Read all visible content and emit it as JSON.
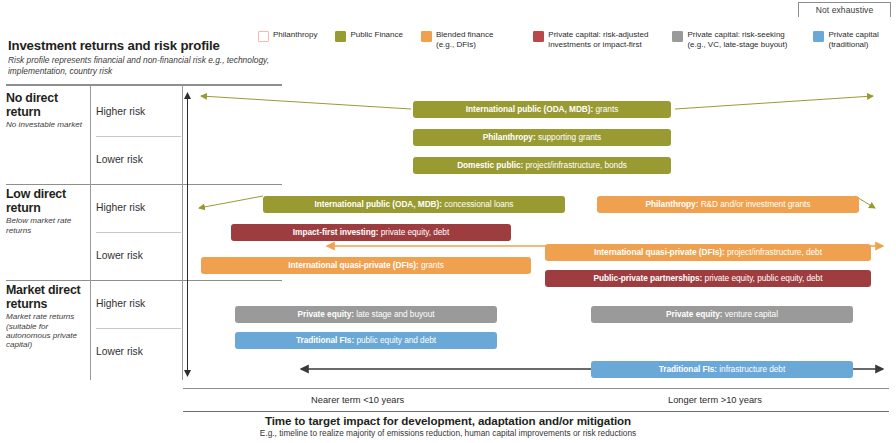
{
  "badge": {
    "label": "Not exhaustive"
  },
  "header": {
    "title": "Investment returns and risk profile",
    "subtitle": "Risk profile represents financial and non-financial risk e.g., technology, implementation, country risk"
  },
  "legend": {
    "items": [
      {
        "label": "Philanthropy",
        "color": "#ffffff",
        "border": "#f4b9b2"
      },
      {
        "label": "Public Finance",
        "color": "#9a9a33",
        "border": "#9a9a33"
      },
      {
        "label": "Blended finance\n(e.g., DFIs)",
        "color": "#efa14f",
        "border": "#efa14f"
      },
      {
        "label": "Private capital: risk-adjusted\ninvestments or impact-first",
        "color": "#b8484b",
        "border": "#b8484b"
      },
      {
        "label": "Private capital: risk-seeking\n(e.g., VC, late-stage buyout)",
        "color": "#9a9a9a",
        "border": "#9a9a9a"
      },
      {
        "label": "Private capital\n(traditional)",
        "color": "#6aa8d8",
        "border": "#6aa8d8"
      }
    ]
  },
  "rows": [
    {
      "title": "No direct return",
      "note": "No investable market",
      "risks": [
        "Higher risk",
        "Lower risk"
      ]
    },
    {
      "title": "Low direct return",
      "note": "Below market rate returns",
      "risks": [
        "Higher risk",
        "Lower risk"
      ]
    },
    {
      "title": "Market direct returns",
      "note": "Market rate returns (suitable for autonomous private capital)",
      "risks": [
        "Higher risk",
        "Lower risk"
      ]
    }
  ],
  "axis": {
    "y_top": "higher",
    "y_bottom": "lower",
    "x_left_label": "Nearer term <10 years",
    "x_right_label": "Longer term >10 years",
    "caption_main": "Time to target impact for development, adaptation and/or mitigation",
    "caption_sub": "E.g., timeline to realize majority of emissions reduction, human capital improvements or risk reductions"
  },
  "chart_data": {
    "type": "bar",
    "title": "Investment returns and risk profile",
    "xlabel": "Time to target impact for development, adaptation and/or mitigation",
    "ylabel": "Investment returns and risk profile",
    "xlim": [
      0,
      706
    ],
    "ylim": [
      0,
      300
    ],
    "grid": false,
    "legend_position": "top",
    "categories": [
      "No direct return / Higher risk",
      "No direct return / Lower risk",
      "Low direct return / Higher risk",
      "Low direct return / Lower risk",
      "Market direct returns / Higher risk",
      "Market direct returns / Lower risk"
    ],
    "bars": [
      {
        "bold": "International public (ODA, MDB):",
        "sub": " grants",
        "category": "Public Finance",
        "color": "#9a9a33",
        "row": "No direct return / Higher risk",
        "x": 230,
        "y": 17,
        "w": 258
      },
      {
        "bold": "Philanthropy:",
        "sub": " supporting grants",
        "category": "Public Finance",
        "color": "#9a9a33",
        "row": "No direct return / Higher risk",
        "x": 230,
        "y": 45,
        "w": 258
      },
      {
        "bold": "Domestic public:",
        "sub": " project/infrastructure, bonds",
        "category": "Public Finance",
        "color": "#9a9a33",
        "row": "No direct return / Lower risk",
        "x": 230,
        "y": 73,
        "w": 258
      },
      {
        "bold": "International public (ODA, MDB):",
        "sub": " concessional loans",
        "category": "Public Finance",
        "color": "#9a9a33",
        "row": "Low direct return / Higher risk",
        "x": 80,
        "y": 112,
        "w": 302
      },
      {
        "bold": "Philanthropy:",
        "sub": " R&D and/or investment grants",
        "category": "Blended finance",
        "color": "#efa14f",
        "row": "Low direct return / Higher risk",
        "x": 414,
        "y": 112,
        "w": 262
      },
      {
        "bold": "Impact-first investing:",
        "sub": " private equity, debt",
        "category": "Private capital: risk-adjusted",
        "color": "#9e3d40",
        "row": "Low direct return / Higher risk",
        "x": 48,
        "y": 140,
        "w": 280
      },
      {
        "bold": "International quasi-private (DFIs):",
        "sub": " project/infrastructure, debt",
        "category": "Blended finance",
        "color": "#efa14f",
        "row": "Low direct return / Lower risk",
        "x": 362,
        "y": 160,
        "w": 326
      },
      {
        "bold": "International quasi-private (DFIs):",
        "sub": " grants",
        "category": "Blended finance",
        "color": "#efa14f",
        "row": "Low direct return / Lower risk",
        "x": 18,
        "y": 173,
        "w": 330
      },
      {
        "bold": "Public-private partnerships:",
        "sub": " private equity, public equity, debt",
        "category": "Private capital: risk-adjusted",
        "color": "#9e3d40",
        "row": "Low direct return / Lower risk",
        "x": 362,
        "y": 186,
        "w": 326
      },
      {
        "bold": "Private equity:",
        "sub": " late stage and buyout",
        "category": "Private capital: risk-seeking",
        "color": "#9a9a9a",
        "row": "Market direct returns / Higher risk",
        "x": 52,
        "y": 222,
        "w": 262
      },
      {
        "bold": "Private equity:",
        "sub": " venture capital",
        "category": "Private capital: risk-seeking",
        "color": "#9a9a9a",
        "row": "Market direct returns / Higher risk",
        "x": 408,
        "y": 222,
        "w": 262
      },
      {
        "bold": "Traditional FIs:",
        "sub": " public equity and debt",
        "category": "Private capital (traditional)",
        "color": "#6aa8d8",
        "row": "Market direct returns / Higher risk",
        "x": 52,
        "y": 248,
        "w": 262
      },
      {
        "bold": "Traditional FIs:",
        "sub": " infrastructure debt",
        "category": "Private capital (traditional)",
        "color": "#6aa8d8",
        "row": "Market direct returns / Lower risk",
        "x": 408,
        "y": 277,
        "w": 262
      }
    ],
    "arrows": [
      {
        "name": "public-finance-spread-top",
        "color": "#9a9a33",
        "x1": 228,
        "y1": 25,
        "x2": 18,
        "y2": 12
      },
      {
        "name": "public-finance-spread-top-right",
        "color": "#9a9a33",
        "x1": 492,
        "y1": 25,
        "x2": 690,
        "y2": 12
      },
      {
        "name": "public-finance-spread-mid-left",
        "color": "#9a9a33",
        "x1": 80,
        "y1": 112,
        "x2": 16,
        "y2": 124
      },
      {
        "name": "blended-finance-spread-mid-right",
        "color": "#9a9a33",
        "x1": 672,
        "y1": 112,
        "x2": 692,
        "y2": 124
      },
      {
        "name": "blended-finance-double-arrow",
        "color": "#efa14f",
        "x1": 144,
        "y1": 162,
        "x2": 700,
        "y2": 162
      },
      {
        "name": "traditional-fis-double-arrow",
        "color": "#3a3a3a",
        "x1": 118,
        "y1": 285,
        "x2": 700,
        "y2": 285
      }
    ]
  }
}
